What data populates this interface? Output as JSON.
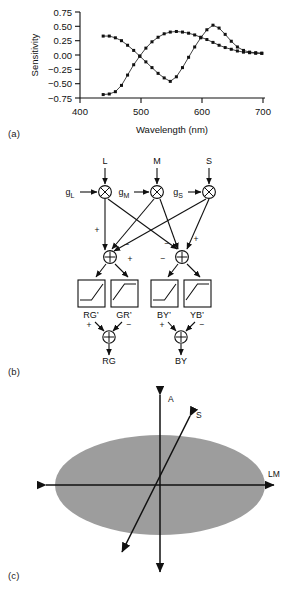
{
  "figure": {
    "panels": [
      {
        "id": "a",
        "label": "(a)"
      },
      {
        "id": "b",
        "label": "(b)"
      },
      {
        "id": "c",
        "label": "(c)"
      }
    ]
  },
  "chart_data": {
    "type": "line",
    "title": "",
    "xlabel": "Wavelength (nm)",
    "ylabel": "Sensitivity",
    "xlim": [
      400,
      700
    ],
    "ylim": [
      -0.75,
      0.75
    ],
    "xticks": [
      400,
      500,
      600,
      700
    ],
    "yticks": [
      -0.75,
      -0.5,
      -0.25,
      0.0,
      0.25,
      0.5,
      0.75
    ],
    "xticklabels": [
      "400",
      "500",
      "600",
      "700"
    ],
    "yticklabels": [
      "0.75",
      "0.50",
      "0.25",
      "0.00",
      "−0.25",
      "−0.50",
      "−0.75"
    ],
    "grid": false,
    "legend": false,
    "marker": "filled-square",
    "series": [
      {
        "name": "BY",
        "x": [
          438,
          448,
          458,
          468,
          478,
          488,
          498,
          508,
          518,
          528,
          538,
          548,
          558,
          568,
          578,
          588,
          598,
          608,
          618,
          628,
          638,
          648,
          658,
          668,
          678,
          688,
          698
        ],
        "y": [
          0.33,
          0.33,
          0.3,
          0.25,
          0.17,
          0.08,
          -0.02,
          -0.12,
          -0.22,
          -0.32,
          -0.4,
          -0.46,
          -0.38,
          -0.22,
          -0.04,
          0.14,
          0.3,
          0.44,
          0.52,
          0.47,
          0.36,
          0.24,
          0.14,
          0.08,
          0.05,
          0.04,
          0.03
        ]
      },
      {
        "name": "RG",
        "x": [
          438,
          448,
          458,
          468,
          478,
          488,
          498,
          508,
          518,
          528,
          538,
          548,
          558,
          568,
          578,
          588,
          598,
          608,
          618,
          628,
          638,
          648,
          658,
          668,
          678,
          688,
          698
        ],
        "y": [
          -0.69,
          -0.68,
          -0.64,
          -0.53,
          -0.35,
          -0.17,
          -0.02,
          0.12,
          0.23,
          0.31,
          0.37,
          0.4,
          0.41,
          0.4,
          0.38,
          0.35,
          0.31,
          0.27,
          0.22,
          0.17,
          0.13,
          0.1,
          0.07,
          0.05,
          0.04,
          0.03,
          0.03
        ]
      }
    ]
  },
  "diagram": {
    "inputs": [
      {
        "name": "L",
        "gain": "g",
        "gain_sub": "L"
      },
      {
        "name": "M",
        "gain": "g",
        "gain_sub": "M"
      },
      {
        "name": "S",
        "gain": "g",
        "gain_sub": "S"
      }
    ],
    "multiply_symbol": "⊗",
    "sum_symbol": "⊕",
    "signs": {
      "plus": "+",
      "minus": "−"
    },
    "rectifiers": [
      {
        "label": "RG’",
        "shape": "half-wave-rising"
      },
      {
        "label": "GR’",
        "shape": "half-wave-falling"
      },
      {
        "label": "BY’",
        "shape": "half-wave-rising"
      },
      {
        "label": "YB’",
        "shape": "half-wave-falling"
      }
    ],
    "outputs": [
      {
        "label": "RG"
      },
      {
        "label": "BY"
      }
    ]
  },
  "colorspace": {
    "axes": [
      {
        "name": "A",
        "orientation": "vertical"
      },
      {
        "name": "S",
        "orientation": "oblique"
      },
      {
        "name": "LM",
        "orientation": "horizontal"
      }
    ],
    "ellipse_fill": "#9d9d9d",
    "line_color": "#111111"
  }
}
